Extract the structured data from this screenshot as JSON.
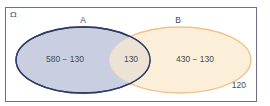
{
  "diagram": {
    "type": "venn",
    "universe": {
      "label": "Ω",
      "outside_value": "120"
    },
    "sets": [
      {
        "name": "A",
        "label": "A",
        "only_value": "580 − 130",
        "fill": "#c9cfe0",
        "stroke": "#2e3a66"
      },
      {
        "name": "B",
        "label": "B",
        "only_value": "430 − 130",
        "fill": "#fbefd9",
        "stroke": "#efc48a"
      }
    ],
    "intersection": {
      "label": "A∩B",
      "value": "130",
      "fill": "#ece2d6"
    },
    "colors": {
      "frame": "#6a6f8a",
      "background": "#ffffff"
    }
  }
}
